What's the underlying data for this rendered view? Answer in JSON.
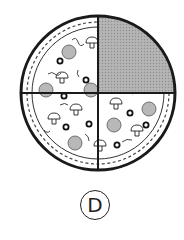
{
  "figure": {
    "total_slices": 4,
    "shaded_slices": 1,
    "shaded_quadrant": "top-right",
    "fraction_shaded": "1/4",
    "shade_color": "#a8a8a8",
    "outline_color": "#1a1a1a"
  },
  "option": {
    "label": "D"
  },
  "toppings": {
    "pepperoni": [
      {
        "x": 69,
        "y": 52
      },
      {
        "x": 46,
        "y": 90
      },
      {
        "x": 91,
        "y": 90
      },
      {
        "x": 75,
        "y": 143
      },
      {
        "x": 114,
        "y": 125
      },
      {
        "x": 149,
        "y": 109
      }
    ],
    "olives": [
      {
        "x": 60,
        "y": 61
      },
      {
        "x": 86,
        "y": 80
      },
      {
        "x": 64,
        "y": 96
      },
      {
        "x": 66,
        "y": 127
      },
      {
        "x": 89,
        "y": 124
      },
      {
        "x": 130,
        "y": 113
      },
      {
        "x": 146,
        "y": 125
      },
      {
        "x": 117,
        "y": 145
      }
    ],
    "mushrooms": [
      {
        "x": 92,
        "y": 43
      },
      {
        "x": 62,
        "y": 78
      },
      {
        "x": 54,
        "y": 119
      },
      {
        "x": 76,
        "y": 110
      },
      {
        "x": 116,
        "y": 104
      },
      {
        "x": 137,
        "y": 131
      },
      {
        "x": 100,
        "y": 146
      }
    ]
  }
}
